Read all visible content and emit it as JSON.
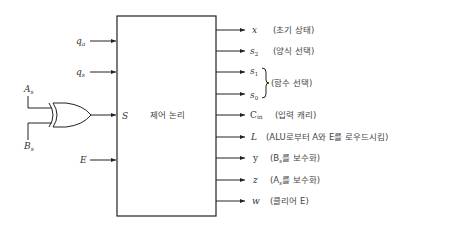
{
  "block": {
    "title": "제어 논리",
    "s_port_label": "S"
  },
  "inputs": {
    "q_a": "q",
    "q_a_sub": "a",
    "q_s": "q",
    "q_s_sub": "s",
    "E": "E",
    "A_s": "A",
    "A_s_sub": "s",
    "B_s": "B",
    "B_s_sub": "s",
    "gate_type": "XOR"
  },
  "outputs": [
    {
      "signal": "x",
      "sub": "",
      "desc": "(초기 상태)"
    },
    {
      "signal": "s",
      "sub": "2",
      "desc": "(양식 선택)"
    },
    {
      "signal": "s",
      "sub": "1",
      "desc": ""
    },
    {
      "signal": "s",
      "sub": "0",
      "desc": ""
    },
    {
      "signal": "C",
      "sub": "in",
      "desc": "(입력 캐리)"
    },
    {
      "signal": "L",
      "sub": "",
      "desc": "(ALU로부터 A와 E를 로우드시킴)"
    },
    {
      "signal": "y",
      "sub": "",
      "desc": "(B"
    },
    {
      "signal": "z",
      "sub": "",
      "desc": "(A"
    },
    {
      "signal": "w",
      "sub": "",
      "desc": "(클리어 E)"
    }
  ],
  "output_details": {
    "y_desc_sub": "s",
    "y_desc_rest": "를 보수화)",
    "z_desc_sub": "s",
    "z_desc_rest": "를 보수화)"
  },
  "brace_group": {
    "members": [
      "s1",
      "s0"
    ],
    "desc": "(함수 선택)"
  }
}
